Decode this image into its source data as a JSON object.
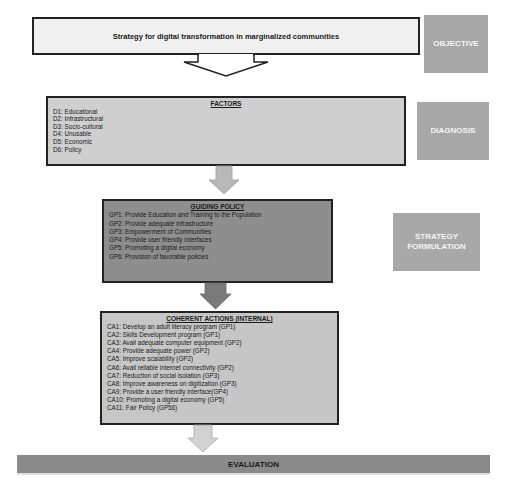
{
  "objective": {
    "text": "Strategy for digital transformation in marginalized communities",
    "stage_label": "OBJECTIVE"
  },
  "diagnosis": {
    "title": "FACTORS",
    "stage_label": "DIAGNOSIS",
    "items": [
      "D1: Educational",
      "D2: Infrastructural",
      "D3: Socio-cultural",
      "D4: Unusable",
      "D5: Economic",
      "D6: Policy"
    ]
  },
  "strategy_formulation": {
    "title": "GUIDING POLICY",
    "stage_label_line1": "STRATEGY",
    "stage_label_line2": "FORMULATION",
    "items": [
      "GP1: Provide Education and Training to the Population",
      "GP2: Provide adequate infrastructure",
      "GP3: Empowerment of Communities",
      "GP4: Provide user friendly interfaces",
      "GP5: Promoting a digital economy",
      "GP6: Provision of favorable policies"
    ]
  },
  "coherent_actions": {
    "title": "COHERENT ACTIONS (INTERNAL)",
    "items": [
      "CA1: Develop an adult literacy program (GP1)",
      "CA2: Skills Development program (GP1)",
      "CA3: Avail adequate computer equipment (GP2)",
      "CA4: Provide adequate power (GP2)",
      "CA5: Improve scalability (GP2)",
      "CA6: Avail reliable internet connectivity (GP2)",
      "CA7: Reduction of social isolation (GP3)",
      "CA8: Improve awareness on digitization (GP3)",
      "CA9: Provide a user friendly interface(GP4)",
      "CA10: Promoting a digital economy (GP5)",
      "CA11: Fair Policy (GP56)"
    ]
  },
  "evaluation": {
    "text": "EVALUATION"
  },
  "colors": {
    "objective_fill": "#f0f0f0",
    "factors_fill": "#cfcfcf",
    "policy_fill": "#8e8e8e",
    "actions_fill": "#c6c6c6",
    "stage_label_fill": "#a8a8a8",
    "evaluation_fill": "#8a8a8a",
    "border": "#222222"
  }
}
